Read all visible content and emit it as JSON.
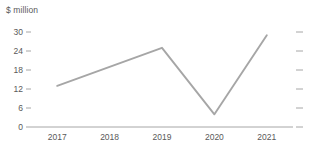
{
  "chart_data": {
    "type": "line",
    "title": "",
    "subtitle": "",
    "xlabel": "",
    "ylabel": "$ million",
    "categories": [
      "2017",
      "2018",
      "2019",
      "2020",
      "2021"
    ],
    "values": [
      13,
      19,
      25,
      4,
      29
    ],
    "series": [
      {
        "name": "$ million",
        "values": [
          13,
          19,
          25,
          4,
          29
        ]
      }
    ],
    "ylim": [
      0,
      30
    ],
    "ytick_labels": [
      "30",
      "24",
      "18",
      "12",
      "6",
      "0"
    ],
    "ytick_values": [
      30,
      24,
      18,
      12,
      6,
      0
    ],
    "grid": false,
    "legend": false,
    "legend_position": "none",
    "line_color": "#a6a6a6",
    "axis_color": "#a6a6a6",
    "text_color": "#595959",
    "background_color": "#ffffff",
    "right_axis_ticks": true,
    "markers": false
  },
  "axis": {
    "y_title": "$ million"
  }
}
